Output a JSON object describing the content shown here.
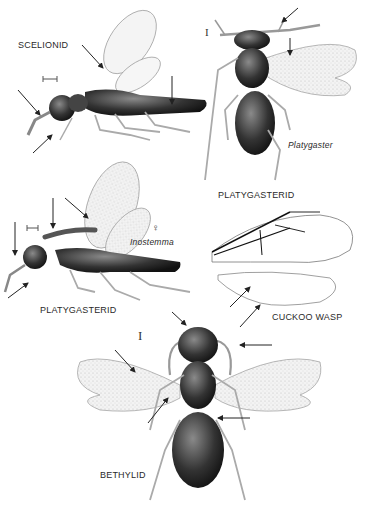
{
  "plate": {
    "labels": {
      "scelionid": "SCELIONID",
      "platygasterid_top": "PLATYGASTERID",
      "platygaster_genus": "Platygaster",
      "platygasterid_left": "PLATYGASTERID",
      "inostemma_genus": "Inostemma",
      "female_symbol": "♀",
      "cuckoo_wasp": "CUCKOO WASP",
      "bethylid": "BETHYLID",
      "scale_bar_symbol": "I"
    },
    "colors": {
      "background": "#ffffff",
      "ink": "#1a1a1a",
      "wing_fill": "#ececec",
      "body_dark": "#2b2b2b",
      "body_mid": "#555555",
      "leg": "#9a9a9a"
    }
  }
}
